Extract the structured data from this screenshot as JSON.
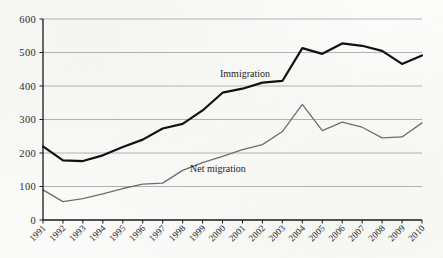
{
  "figure": {
    "background_color": "#fcfcfa",
    "plot_area": {
      "left": 43,
      "top": 19,
      "right": 422,
      "bottom": 220
    }
  },
  "axes": {
    "y_ticks": [
      "0",
      "100",
      "200",
      "300",
      "400",
      "500",
      "600"
    ],
    "x_ticks": [
      "1991",
      "1992",
      "1993",
      "1994",
      "1995",
      "1996",
      "1997",
      "1998",
      "1999",
      "2000",
      "2001",
      "2002",
      "2003",
      "2004",
      "2005",
      "2006",
      "2007",
      "2008",
      "2009",
      "2010"
    ],
    "gridline_color": "#a9a9a9",
    "axis_color": "#1a1a1a"
  },
  "annotations": {
    "immigration_label": "Immigration",
    "net_migration_label": "Net migration"
  },
  "chart_data": {
    "type": "line",
    "title": "",
    "subtitle": "",
    "xlabel": "",
    "ylabel": "",
    "xlim_categories": [
      "1991",
      "1992",
      "1993",
      "1994",
      "1995",
      "1996",
      "1997",
      "1998",
      "1999",
      "2000",
      "2001",
      "2002",
      "2003",
      "2004",
      "2005",
      "2006",
      "2007",
      "2008",
      "2009",
      "2010"
    ],
    "ylim": [
      0,
      600
    ],
    "y_tick_step": 100,
    "grid": "horizontal",
    "legend_position": "inline-annotations",
    "categories": [
      "1991",
      "1992",
      "1993",
      "1994",
      "1995",
      "1996",
      "1997",
      "1998",
      "1999",
      "2000",
      "2001",
      "2002",
      "2003",
      "2004",
      "2005",
      "2006",
      "2007",
      "2008",
      "2009",
      "2010"
    ],
    "series": [
      {
        "name": "Immigration",
        "color": "#111111",
        "line_width": 2.2,
        "values": [
          220,
          178,
          176,
          193,
          218,
          240,
          273,
          287,
          327,
          380,
          392,
          410,
          415,
          513,
          496,
          527,
          520,
          505,
          466,
          491
        ]
      },
      {
        "name": "Net migration",
        "color": "#6e6e6e",
        "line_width": 1.3,
        "values": [
          90,
          55,
          64,
          78,
          94,
          107,
          110,
          148,
          171,
          190,
          210,
          225,
          264,
          345,
          267,
          292,
          277,
          245,
          248,
          290
        ]
      }
    ]
  }
}
